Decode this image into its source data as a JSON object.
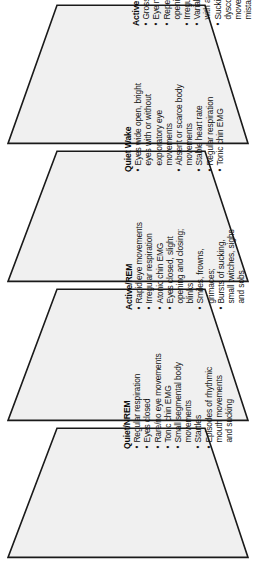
{
  "diagram": {
    "orientation": "rotated-90",
    "shape": "trapezoid",
    "fill_color": "#f0f0f0",
    "stroke_color": "#1a1a1a",
    "bullet_glyph": "•",
    "states": [
      {
        "id": "active-wake",
        "name": "Active Wake",
        "bullets": [
          {
            "lines": [
              "Gross body movements"
            ]
          },
          {
            "lines": [
              "Eye movements"
            ]
          },
          {
            "lines": [
              "Repetitive eye",
              "opening and closing"
            ]
          },
          {
            "lines": [
              "Irregular respiration"
            ]
          },
          {
            "lines": [
              "Variable heart rate",
              "with acceleration"
            ]
          },
          {
            "lines": [
              "Sucking, puckering,",
              "dysconjugate eye",
              "movements (do not",
              "mistake for SZs)"
            ]
          }
        ]
      },
      {
        "id": "quiet-wake",
        "name": "Quiet Wake",
        "bullets": [
          {
            "lines": [
              "Eyes wide open, bright",
              "eyes with or without",
              "exploratory eye",
              "movements"
            ]
          },
          {
            "lines": [
              "Absent or scarce body",
              "movements"
            ]
          },
          {
            "lines": [
              "Stable heart rate"
            ]
          },
          {
            "lines": [
              "Regular respiration"
            ]
          },
          {
            "lines": [
              "Tonic chin EMG"
            ]
          }
        ]
      },
      {
        "id": "active-rem",
        "name": "Active/REM",
        "bullets": [
          {
            "lines": [
              "Rapid eye movements"
            ]
          },
          {
            "lines": [
              "Irregular respiration"
            ]
          },
          {
            "lines": [
              "Atonic chin EMG"
            ]
          },
          {
            "lines": [
              "Eyes closed, slight",
              "opening and closing;",
              "blinks;"
            ]
          },
          {
            "lines": [
              "Smiles, frowns,",
              "grimaces;"
            ]
          },
          {
            "lines": [
              "Bursts of sucking,",
              "small twitches, sighs",
              "and sobs"
            ]
          }
        ]
      },
      {
        "id": "quiet-nrem",
        "name": "Quiet/NREM",
        "bullets": [
          {
            "lines": [
              "Regular respiration"
            ]
          },
          {
            "lines": [
              "Eyes closed"
            ]
          },
          {
            "lines": [
              "Rare/no eye movements"
            ]
          },
          {
            "lines": [
              "Tonic chin EMG"
            ]
          },
          {
            "lines": [
              "Small segmental body",
              "movements"
            ]
          },
          {
            "lines": [
              "Startles"
            ]
          },
          {
            "lines": [
              "Episodes of rhythmic",
              "mouth movements",
              "and sucking"
            ]
          }
        ]
      }
    ]
  }
}
